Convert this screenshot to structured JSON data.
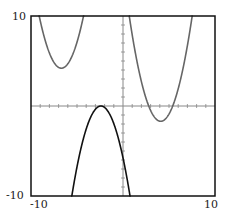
{
  "chart_data": {
    "type": "line",
    "title": "",
    "xlabel": "",
    "ylabel": "",
    "xlim": [
      -10,
      10
    ],
    "ylim": [
      -10,
      10
    ],
    "grid": false,
    "axes_ticks": "unit tick marks on both axes through origin",
    "tick_labels": {
      "x_min": "-10",
      "x_max": "10",
      "y_min": "-10",
      "y_max": "10"
    },
    "series": [
      {
        "name": "upper-left parabola",
        "color": "#666666",
        "formula": "y = (x + 6.7)^2 + 4.2",
        "vertex": [
          -6.7,
          4.2
        ]
      },
      {
        "name": "upper-right parabola",
        "color": "#666666",
        "formula": "y = (x - 4.1)^2 - 1.7",
        "vertex": [
          4.1,
          -1.7
        ]
      },
      {
        "name": "lower inverted parabola",
        "color": "#111111",
        "formula": "y = -(x + 2.4)^2",
        "vertex": [
          -2.4,
          0
        ]
      }
    ]
  },
  "labels": {
    "y_top": "10",
    "y_bottom": "-10",
    "x_left": "-10",
    "x_right": "10"
  }
}
